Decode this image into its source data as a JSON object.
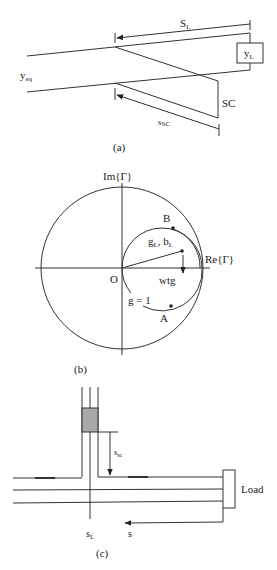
{
  "figure": {
    "panels": [
      {
        "id": "a",
        "caption": "(a)",
        "labels": {
          "distance_load": "S",
          "distance_load_sub": "L",
          "load_admittance": "y",
          "load_admittance_sub": "L",
          "equivalent_admittance": "y",
          "equivalent_admittance_sub": "eq",
          "short_circuit": "SC",
          "stub_length": "s",
          "stub_length_sub": "SC"
        }
      },
      {
        "id": "b",
        "caption": "(b)",
        "labels": {
          "imag_axis": "Im{Γ}",
          "real_axis": "Re{Γ}",
          "origin": "O",
          "point_b": "B",
          "point_a": "A",
          "load_point": "g",
          "load_point_sub1": "L",
          "load_point_mid": ", b",
          "load_point_sub2": "L",
          "rotation": "wtg",
          "unit_conductance_circle": "g = 1"
        }
      },
      {
        "id": "c",
        "caption": "(c)",
        "labels": {
          "stub_length": "s",
          "stub_length_sub": "sc",
          "load": "Load",
          "stub_position": "s",
          "stub_position_sub": "L",
          "position_axis": "s"
        }
      }
    ],
    "colors": {
      "line": "#333333",
      "shaded_box": "#a8a8a8",
      "background": "#ffffff"
    }
  }
}
